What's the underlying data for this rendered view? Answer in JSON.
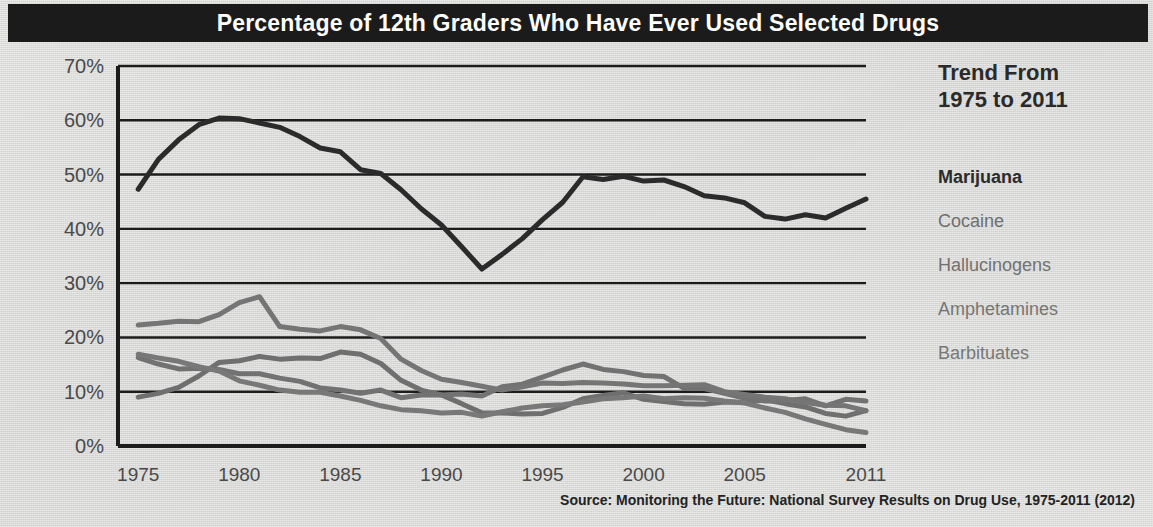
{
  "title": "Percentage of 12th Graders Who Have Ever Used Selected Drugs",
  "legend": {
    "heading": "Trend From\n1975 to 2011",
    "items": [
      {
        "label": "Marijuana",
        "color": "#2b2b2b"
      },
      {
        "label": "Cocaine",
        "color": "#6f6f6f"
      },
      {
        "label": "Hallucinogens",
        "color": "#727272"
      },
      {
        "label": "Amphetamines",
        "color": "#757575"
      },
      {
        "label": "Barbituates",
        "color": "#787878"
      }
    ]
  },
  "source": "Source: Monitoring the Future: National Survey Results on Drug Use, 1975-2011 (2012)",
  "chart_data": {
    "type": "line",
    "title": "Percentage of 12th Graders Who Have Ever Used Selected Drugs",
    "xlabel": "",
    "ylabel": "",
    "xlim": [
      1974,
      2011
    ],
    "ylim": [
      0,
      70
    ],
    "grid": true,
    "legend_position": "right",
    "y_ticks": [
      "0%",
      "10%",
      "20%",
      "30%",
      "40%",
      "50%",
      "60%",
      "70%"
    ],
    "y_tick_values": [
      0,
      10,
      20,
      30,
      40,
      50,
      60,
      70
    ],
    "x_ticks": [
      "1975",
      "1980",
      "1985",
      "1990",
      "1995",
      "2000",
      "2005",
      "2011"
    ],
    "x_tick_values": [
      1975,
      1980,
      1985,
      1990,
      1995,
      2000,
      2005,
      2011
    ],
    "x": [
      1975,
      1976,
      1977,
      1978,
      1979,
      1980,
      1981,
      1982,
      1983,
      1984,
      1985,
      1986,
      1987,
      1988,
      1989,
      1990,
      1991,
      1992,
      1993,
      1994,
      1995,
      1996,
      1997,
      1998,
      1999,
      2000,
      2001,
      2002,
      2003,
      2004,
      2005,
      2006,
      2007,
      2008,
      2009,
      2010,
      2011
    ],
    "series": [
      {
        "name": "Marijuana",
        "color": "#2b2b2b",
        "width": 5,
        "values": [
          47.3,
          52.8,
          56.4,
          59.2,
          60.4,
          60.3,
          59.5,
          58.7,
          57.0,
          54.9,
          54.2,
          50.9,
          50.2,
          47.2,
          43.7,
          40.7,
          36.7,
          32.6,
          35.3,
          38.2,
          41.7,
          44.9,
          49.6,
          49.1,
          49.7,
          48.8,
          49.0,
          47.8,
          46.1,
          45.7,
          44.8,
          42.3,
          41.8,
          42.6,
          42.0,
          43.8,
          45.5
        ]
      },
      {
        "name": "Cocaine",
        "color": "#6f6f6f",
        "width": 5,
        "values": [
          9.0,
          9.7,
          10.8,
          12.9,
          15.4,
          15.7,
          16.5,
          16.0,
          16.2,
          16.1,
          17.3,
          16.9,
          15.2,
          12.1,
          10.3,
          9.4,
          7.8,
          6.1,
          6.1,
          5.9,
          6.0,
          7.1,
          8.7,
          9.3,
          9.8,
          8.6,
          8.2,
          7.8,
          7.7,
          8.1,
          8.0,
          8.5,
          7.8,
          7.2,
          6.0,
          5.5,
          6.5
        ]
      },
      {
        "name": "Hallucinogens",
        "color": "#727272",
        "width": 5,
        "values": [
          16.3,
          15.1,
          14.2,
          14.3,
          14.1,
          13.3,
          13.3,
          12.5,
          11.9,
          10.7,
          10.3,
          9.7,
          10.3,
          8.9,
          9.4,
          9.4,
          9.6,
          9.2,
          10.9,
          11.4,
          12.7,
          14.0,
          15.1,
          14.1,
          13.7,
          13.0,
          12.8,
          10.6,
          10.6,
          9.7,
          8.8,
          8.3,
          8.4,
          8.7,
          7.4,
          8.6,
          8.3
        ]
      },
      {
        "name": "Amphetamines",
        "color": "#757575",
        "width": 5,
        "values": [
          22.3,
          22.6,
          23.0,
          22.9,
          24.2,
          26.4,
          27.5,
          22.0,
          21.5,
          21.2,
          22.0,
          21.4,
          19.8,
          16.0,
          13.9,
          12.3,
          11.7,
          11.0,
          10.3,
          10.9,
          11.6,
          11.5,
          11.7,
          11.6,
          11.4,
          11.1,
          11.1,
          11.2,
          11.3,
          10.0,
          9.5,
          9.0,
          8.7,
          8.0,
          7.5,
          7.4,
          6.5
        ]
      },
      {
        "name": "Barbituates",
        "color": "#787878",
        "width": 5,
        "values": [
          16.9,
          16.2,
          15.6,
          14.6,
          13.8,
          12.0,
          11.2,
          10.3,
          9.9,
          9.9,
          9.2,
          8.4,
          7.4,
          6.7,
          6.5,
          6.1,
          6.2,
          5.5,
          6.3,
          7.0,
          7.4,
          7.6,
          8.1,
          8.7,
          8.9,
          9.2,
          8.7,
          8.9,
          8.8,
          8.3,
          7.9,
          7.0,
          6.2,
          5.0,
          4.0,
          3.0,
          2.5
        ]
      }
    ]
  }
}
